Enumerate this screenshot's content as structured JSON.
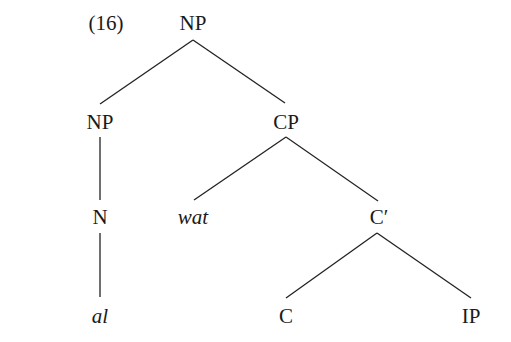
{
  "example_number": "(16)",
  "tree": {
    "nodes": [
      {
        "id": "np_root",
        "label": "NP",
        "italic": false
      },
      {
        "id": "np_left",
        "label": "NP",
        "italic": false
      },
      {
        "id": "cp",
        "label": "CP",
        "italic": false
      },
      {
        "id": "n",
        "label": "N",
        "italic": false
      },
      {
        "id": "wat",
        "label": "wat",
        "italic": true
      },
      {
        "id": "cbar",
        "label": "C′",
        "italic": false
      },
      {
        "id": "al",
        "label": "al",
        "italic": true
      },
      {
        "id": "c",
        "label": "C",
        "italic": false
      },
      {
        "id": "ip",
        "label": "IP",
        "italic": false
      }
    ],
    "edges": [
      [
        "NP",
        "NP"
      ],
      [
        "NP",
        "CP"
      ],
      [
        "NP",
        "N"
      ],
      [
        "N",
        "al"
      ],
      [
        "CP",
        "wat"
      ],
      [
        "CP",
        "C′"
      ],
      [
        "C′",
        "C"
      ],
      [
        "C′",
        "IP"
      ]
    ]
  }
}
